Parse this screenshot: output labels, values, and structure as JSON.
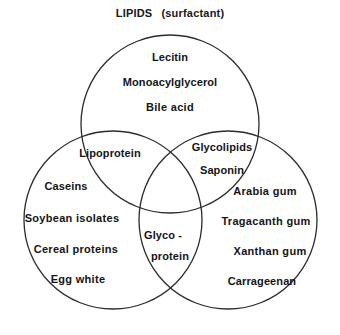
{
  "figure": {
    "title_main": "LIPIDS",
    "title_sub": "(surfactant)",
    "stroke_color": "#2b2b2b",
    "text_color": "#141416",
    "background": "#ffffff"
  },
  "sets": {
    "top": {
      "name": "lipids-surfactant",
      "items": [
        "Lecitin",
        "Monoacylglycerol",
        "Bile acid"
      ]
    },
    "left": {
      "name": "proteins",
      "items": [
        "Caseins",
        "Soybean isolates",
        "Cereal proteins",
        "Egg white"
      ]
    },
    "right": {
      "name": "polysaccharides",
      "items": [
        "Arabia gum",
        "Tragacanth gum",
        "Xanthan gum",
        "Carrageenan"
      ]
    }
  },
  "intersections": {
    "top_left": {
      "name": "lipid-protein",
      "items": [
        "Lipoprotein"
      ]
    },
    "top_right": {
      "name": "lipid-polysaccharide",
      "items": [
        "Glycolipids",
        "Saponin"
      ]
    },
    "center": {
      "name": "glyco-protein",
      "line1": "Glyco -",
      "line2": "protein"
    }
  }
}
